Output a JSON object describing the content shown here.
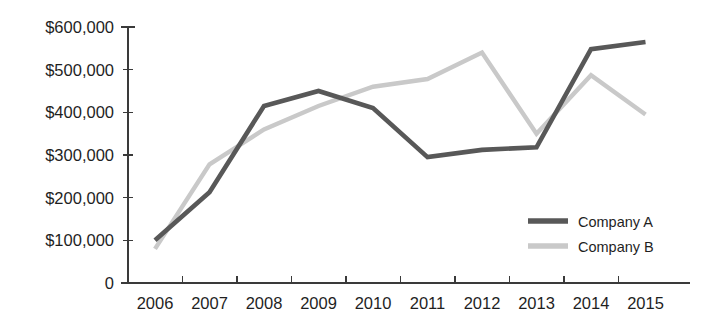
{
  "chart_data": {
    "type": "line",
    "title": "",
    "xlabel": "",
    "ylabel": "",
    "categories": [
      "2006",
      "2007",
      "2008",
      "2009",
      "2010",
      "2011",
      "2012",
      "2013",
      "2014",
      "2015"
    ],
    "series": [
      {
        "name": "Company A",
        "color": "#585858",
        "values": [
          100000,
          213000,
          415000,
          450000,
          410000,
          295000,
          312000,
          318000,
          548000,
          565000
        ]
      },
      {
        "name": "Company B",
        "color": "#c9c9c9",
        "values": [
          80000,
          278000,
          360000,
          415000,
          460000,
          478000,
          540000,
          350000,
          487000,
          395000
        ]
      }
    ],
    "ylim": [
      0,
      600000
    ],
    "ytick_values": [
      0,
      100000,
      200000,
      300000,
      400000,
      500000,
      600000
    ],
    "ytick_labels": [
      "0",
      "$100,000",
      "$200,000",
      "$300,000",
      "$400,000",
      "$500,000",
      "$600,000"
    ],
    "grid": false,
    "legend_position": "center-right"
  },
  "legend": {
    "items": [
      {
        "label": "Company A",
        "color": "#585858"
      },
      {
        "label": "Company B",
        "color": "#c9c9c9"
      }
    ]
  },
  "axis": {
    "y_axis_name": "y-axis",
    "x_axis_name": "x-axis"
  }
}
